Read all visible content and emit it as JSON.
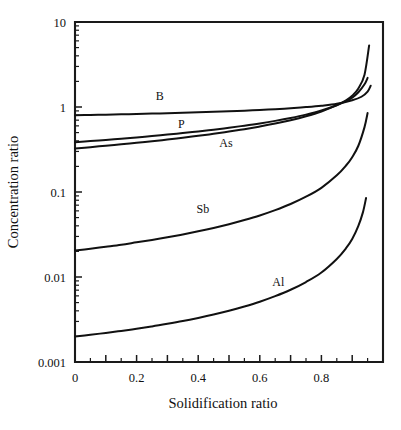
{
  "chart_data": {
    "type": "line",
    "title": "",
    "xlabel": "Solidification ratio",
    "ylabel": "Concentration ratio",
    "xlim": [
      0,
      1
    ],
    "ylim": [
      0.001,
      10
    ],
    "yscale": "log",
    "xscale": "linear",
    "grid": false,
    "legend": "inline-labels",
    "xticks": [
      0,
      0.1,
      0.2,
      0.3,
      0.4,
      0.5,
      0.6,
      0.7,
      0.8,
      0.9,
      1.0
    ],
    "xticklabels": [
      "0",
      "",
      "0.2",
      "",
      "0.4",
      "",
      "0.6",
      "",
      "0.8",
      "",
      ""
    ],
    "yticks": [
      10,
      1,
      0.1,
      0.01,
      0.001
    ],
    "yticklabels": [
      "10",
      "1",
      "0.1",
      "0.01",
      "0.001"
    ],
    "series": [
      {
        "name": "B",
        "label": "B",
        "label_x": 0.275,
        "label_y": 1.22,
        "x": [
          0.0,
          0.05,
          0.1,
          0.15,
          0.2,
          0.25,
          0.3,
          0.35,
          0.4,
          0.45,
          0.5,
          0.55,
          0.6,
          0.65,
          0.7,
          0.75,
          0.8,
          0.85,
          0.9,
          0.93,
          0.95,
          0.96
        ],
        "y": [
          0.8,
          0.806,
          0.813,
          0.82,
          0.828,
          0.836,
          0.845,
          0.855,
          0.866,
          0.878,
          0.891,
          0.906,
          0.923,
          0.943,
          0.967,
          0.997,
          1.035,
          1.09,
          1.2,
          1.32,
          1.52,
          1.78
        ]
      },
      {
        "name": "P",
        "label": "P",
        "label_x": 0.345,
        "label_y": 0.56,
        "x": [
          0.0,
          0.05,
          0.1,
          0.15,
          0.2,
          0.25,
          0.3,
          0.35,
          0.4,
          0.45,
          0.5,
          0.55,
          0.6,
          0.65,
          0.7,
          0.75,
          0.8,
          0.85,
          0.88,
          0.9,
          0.92,
          0.94,
          0.95
        ],
        "y": [
          0.385,
          0.397,
          0.41,
          0.424,
          0.439,
          0.456,
          0.474,
          0.494,
          0.516,
          0.541,
          0.57,
          0.603,
          0.641,
          0.687,
          0.743,
          0.814,
          0.91,
          1.05,
          1.17,
          1.29,
          1.49,
          1.85,
          2.2
        ]
      },
      {
        "name": "As",
        "label": "As",
        "label_x": 0.49,
        "label_y": 0.335,
        "x": [
          0.0,
          0.05,
          0.1,
          0.15,
          0.2,
          0.25,
          0.3,
          0.35,
          0.4,
          0.45,
          0.5,
          0.55,
          0.6,
          0.65,
          0.7,
          0.75,
          0.8,
          0.85,
          0.88,
          0.9,
          0.92,
          0.94,
          0.955
        ],
        "y": [
          0.325,
          0.337,
          0.35,
          0.364,
          0.379,
          0.396,
          0.414,
          0.435,
          0.458,
          0.484,
          0.514,
          0.549,
          0.59,
          0.639,
          0.7,
          0.779,
          0.886,
          1.05,
          1.2,
          1.36,
          1.65,
          2.4,
          5.3
        ]
      },
      {
        "name": "Sb",
        "label": "Sb",
        "label_x": 0.415,
        "label_y": 0.057,
        "x": [
          0.0,
          0.05,
          0.1,
          0.15,
          0.2,
          0.25,
          0.3,
          0.35,
          0.4,
          0.45,
          0.5,
          0.55,
          0.6,
          0.65,
          0.7,
          0.75,
          0.8,
          0.85,
          0.88,
          0.9,
          0.92,
          0.94,
          0.95
        ],
        "y": [
          0.0205,
          0.0215,
          0.0227,
          0.024,
          0.0256,
          0.0273,
          0.0293,
          0.0317,
          0.0345,
          0.0378,
          0.0418,
          0.0468,
          0.053,
          0.0612,
          0.0722,
          0.088,
          0.112,
          0.157,
          0.205,
          0.257,
          0.35,
          0.58,
          0.85
        ]
      },
      {
        "name": "Al",
        "label": "Al",
        "label_x": 0.66,
        "label_y": 0.0078,
        "x": [
          0.0,
          0.05,
          0.1,
          0.15,
          0.2,
          0.25,
          0.3,
          0.35,
          0.4,
          0.45,
          0.5,
          0.55,
          0.6,
          0.65,
          0.7,
          0.75,
          0.8,
          0.85,
          0.88,
          0.9,
          0.92,
          0.935,
          0.945
        ],
        "y": [
          0.002,
          0.00209,
          0.0022,
          0.00232,
          0.00246,
          0.00262,
          0.00281,
          0.00303,
          0.0033,
          0.00362,
          0.00401,
          0.0045,
          0.00512,
          0.00595,
          0.00708,
          0.00873,
          0.0113,
          0.0163,
          0.0218,
          0.028,
          0.04,
          0.058,
          0.085
        ]
      }
    ]
  },
  "plot_geometry": {
    "left": 75,
    "right": 383,
    "top": 22,
    "bottom": 362
  },
  "colors": {
    "line": "#111111",
    "axis": "#1a1a1a",
    "background": "#ffffff"
  }
}
